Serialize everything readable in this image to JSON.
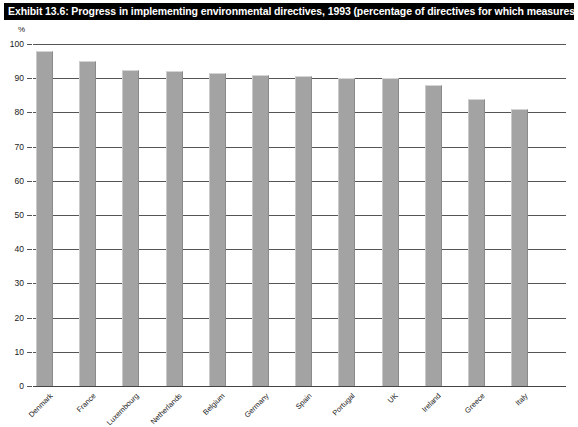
{
  "exhibit": {
    "title": "Exhibit 13.6: Progress in implementing environmental directives, 1993 (percentage of directives for which measures notified)",
    "unit_label": "%"
  },
  "chart_data": {
    "type": "bar",
    "title": "Exhibit 13.6: Progress in implementing environmental directives, 1993 (percentage of directives for which measures notified)",
    "xlabel": "",
    "ylabel": "%",
    "ylim": [
      0,
      100
    ],
    "ytick_labels": [
      "0",
      "10",
      "20",
      "30",
      "40",
      "50",
      "60",
      "70",
      "80",
      "90",
      "100"
    ],
    "ytick_values": [
      0,
      10,
      20,
      30,
      40,
      50,
      60,
      70,
      80,
      90,
      100
    ],
    "grid": true,
    "legend": "none",
    "bar_color": "#a3a3a3",
    "categories": [
      "Denmark",
      "France",
      "Luxembourg",
      "Netherlands",
      "Belgium",
      "Germany",
      "Spain",
      "Portugal",
      "UK",
      "Ireland",
      "Greece",
      "Italy"
    ],
    "values": [
      98,
      95,
      92.5,
      92,
      91.5,
      91,
      90.5,
      90,
      90,
      88,
      84,
      81
    ]
  }
}
